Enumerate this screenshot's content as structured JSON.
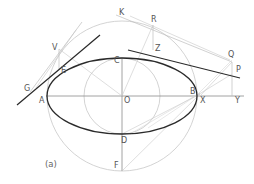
{
  "figure": {
    "caption": "(a)",
    "colors": {
      "ellipse": "#2a2a2a",
      "tangent": "#2a2a2a",
      "construction": "#bdbdbd",
      "axis": "#8a8a8a",
      "label": "#555555"
    },
    "points": {
      "O": {
        "label": "O"
      },
      "A": {
        "label": "A"
      },
      "B": {
        "label": "B"
      },
      "C": {
        "label": "C"
      },
      "D": {
        "label": "D"
      },
      "E": {
        "label": "E"
      },
      "F": {
        "label": "F"
      },
      "G": {
        "label": "G"
      },
      "K": {
        "label": "K"
      },
      "P": {
        "label": "P"
      },
      "Q": {
        "label": "Q"
      },
      "R": {
        "label": "R"
      },
      "V": {
        "label": "V"
      },
      "X": {
        "label": "X"
      },
      "Y": {
        "label": "Y"
      },
      "Z": {
        "label": "Z"
      }
    }
  }
}
